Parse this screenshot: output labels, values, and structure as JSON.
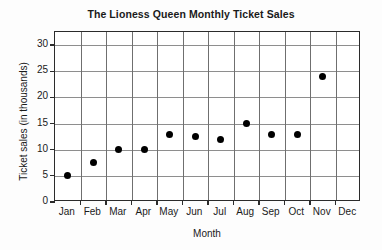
{
  "chart_data": {
    "type": "scatter",
    "title": "The Lioness Queen Monthly Ticket Sales",
    "xlabel": "Month",
    "ylabel": "Ticket sales (in thousands)",
    "categories": [
      "Jan",
      "Feb",
      "Mar",
      "Apr",
      "May",
      "Jun",
      "Jul",
      "Aug",
      "Sep",
      "Oct",
      "Nov",
      "Dec"
    ],
    "values": [
      5,
      7.5,
      10,
      10,
      13,
      12.5,
      12,
      15,
      13,
      13,
      24,
      null
    ],
    "ylim": [
      0,
      32.5
    ],
    "yticks": [
      0,
      5,
      10,
      15,
      20,
      25,
      30
    ],
    "ytick_labels": [
      "0",
      "5",
      "10",
      "15",
      "20",
      "25",
      "30"
    ],
    "grid": true,
    "grid_axis": "both",
    "legend": false,
    "marker_color": "#000000",
    "marker_shape": "circle",
    "frame_color": "#2b2b2b",
    "grid_color": "#8e8e8e",
    "background_color": "#ffffff",
    "note_missing": "Dec has no plotted data point"
  }
}
